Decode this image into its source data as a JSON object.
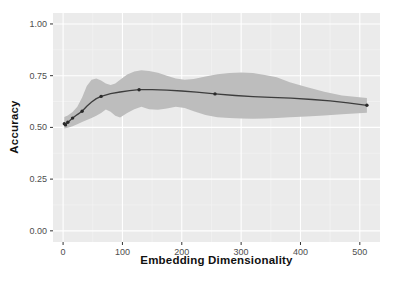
{
  "figure": {
    "background": "#ffffff",
    "panel_bg": "#ebebeb",
    "grid_major_color": "#ffffff",
    "grid_minor_color": "#f4f4f4",
    "ribbon_color": "#bdbdbd",
    "line_color": "#3d3d3d",
    "point_color": "#2a2a2a",
    "tick_mark_color": "#333333",
    "tick_label_color": "#4d4d4d",
    "axis_title_color": "#111111"
  },
  "chart_data": {
    "type": "line",
    "title": "",
    "xlabel": "Embedding Dimensionality",
    "ylabel": "Accuracy",
    "legend": false,
    "grid": true,
    "xlim": [
      0,
      512
    ],
    "ylim": [
      0,
      1
    ],
    "xlim_expanded": [
      -17,
      534
    ],
    "ylim_expanded": [
      -0.054,
      1.053
    ],
    "x_ticks": [
      0,
      100,
      200,
      300,
      400,
      500
    ],
    "x_tick_labels": [
      "0",
      "100",
      "200",
      "300",
      "400",
      "500"
    ],
    "x_minor_ticks": [
      50,
      150,
      250,
      350,
      450
    ],
    "y_ticks": [
      0,
      0.25,
      0.5,
      0.75,
      1
    ],
    "y_tick_labels": [
      "0.00",
      "0.25",
      "0.50",
      "0.75",
      "1.00"
    ],
    "y_minor_ticks": [
      0.125,
      0.375,
      0.625,
      0.875
    ],
    "series": [
      {
        "name": "smoothed-accuracy",
        "x": [
          2,
          4,
          8,
          16,
          24,
          32,
          40,
          48,
          56,
          64,
          80,
          96,
          112,
          128,
          150,
          175,
          200,
          225,
          256,
          290,
          320,
          350,
          384,
          420,
          450,
          480,
          512
        ],
        "y": [
          0.518,
          0.513,
          0.524,
          0.545,
          0.562,
          0.578,
          0.602,
          0.623,
          0.639,
          0.65,
          0.663,
          0.671,
          0.678,
          0.682,
          0.682,
          0.68,
          0.676,
          0.67,
          0.662,
          0.654,
          0.649,
          0.645,
          0.641,
          0.635,
          0.628,
          0.619,
          0.607
        ]
      }
    ],
    "points": {
      "name": "measured-accuracy",
      "x": [
        2,
        4,
        8,
        16,
        32,
        64,
        128,
        256,
        512
      ],
      "y": [
        0.518,
        0.512,
        0.525,
        0.545,
        0.578,
        0.65,
        0.682,
        0.662,
        0.607
      ]
    },
    "ribbon": {
      "name": "confidence-band",
      "x": [
        2,
        8,
        16,
        24,
        32,
        40,
        48,
        56,
        64,
        72,
        80,
        88,
        96,
        108,
        120,
        132,
        145,
        160,
        175,
        190,
        205,
        220,
        240,
        260,
        280,
        300,
        320,
        340,
        360,
        382,
        410,
        440,
        470,
        512
      ],
      "upper": [
        0.55,
        0.558,
        0.575,
        0.6,
        0.645,
        0.7,
        0.73,
        0.737,
        0.727,
        0.712,
        0.705,
        0.712,
        0.73,
        0.755,
        0.77,
        0.776,
        0.772,
        0.764,
        0.75,
        0.737,
        0.73,
        0.734,
        0.746,
        0.757,
        0.763,
        0.766,
        0.763,
        0.754,
        0.742,
        0.718,
        0.695,
        0.672,
        0.654,
        0.642
      ],
      "lower": [
        0.494,
        0.498,
        0.506,
        0.515,
        0.526,
        0.536,
        0.546,
        0.556,
        0.57,
        0.586,
        0.576,
        0.556,
        0.548,
        0.57,
        0.588,
        0.6,
        0.588,
        0.585,
        0.592,
        0.6,
        0.594,
        0.578,
        0.56,
        0.549,
        0.545,
        0.543,
        0.542,
        0.543,
        0.546,
        0.549,
        0.553,
        0.558,
        0.564,
        0.571
      ]
    }
  }
}
